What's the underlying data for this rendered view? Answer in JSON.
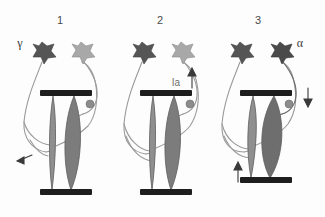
{
  "figure": {
    "background_color": "#fdfdfd",
    "width": 325,
    "height": 217
  },
  "colors": {
    "neuron_dark": "#555555",
    "neuron_light": "#a8a8a8",
    "neuron_darkest": "#4a4a4a",
    "muscle_spindle_fill": "#8f8f8f",
    "muscle_extrafusal_fill": "#7c7c7c",
    "muscle_contracted_fill": "#6e6e6e",
    "bar_black": "#1e1e1e",
    "axon_gray": "#9a9a9a",
    "label_gray": "#4a4a4a",
    "bouton_gray": "#8c8c8c"
  },
  "panels": [
    {
      "id": "panel-1",
      "number": "1",
      "number_x": 60,
      "number_y": 22,
      "labels": [
        {
          "name": "gamma-label",
          "text": "γ",
          "x": 20,
          "y": 46
        }
      ],
      "neurons": [
        {
          "name": "gamma-motor-neuron-soma",
          "shade": "dark",
          "cx": 42,
          "cy": 53
        },
        {
          "name": "alpha-motor-neuron-soma",
          "shade": "light",
          "cx": 81,
          "cy": 53
        }
      ],
      "muscle": {
        "state": "relaxed",
        "spindle_label": "intrafusal-muscle-spindle",
        "extrafusal_label": "extrafusal-muscle-fiber",
        "top_bar_y": 93,
        "bottom_bar_y": 192
      },
      "arrows": [
        {
          "name": "stretch-arrow-diagonal",
          "direction": "down-left",
          "x": 22,
          "y": 157
        }
      ]
    },
    {
      "id": "panel-2",
      "number": "2",
      "number_x": 160,
      "number_y": 22,
      "labels": [
        {
          "name": "ia-afferent-label",
          "text": "Ia",
          "x": 176,
          "y": 82
        }
      ],
      "neurons": [
        {
          "name": "gamma-motor-neuron-soma",
          "shade": "dark",
          "cx": 142,
          "cy": 53
        },
        {
          "name": "alpha-motor-neuron-soma",
          "shade": "light",
          "cx": 181,
          "cy": 53
        }
      ],
      "muscle": {
        "state": "relaxed",
        "spindle_label": "intrafusal-muscle-spindle",
        "extrafusal_label": "extrafusal-muscle-fiber",
        "top_bar_y": 93,
        "bottom_bar_y": 192
      },
      "arrows": [
        {
          "name": "ia-afferent-arrow-up",
          "direction": "up",
          "x": 192,
          "y": 78
        }
      ]
    },
    {
      "id": "panel-3",
      "number": "3",
      "number_x": 258,
      "number_y": 22,
      "labels": [
        {
          "name": "alpha-label",
          "text": "α",
          "x": 298,
          "y": 46
        }
      ],
      "neurons": [
        {
          "name": "gamma-motor-neuron-soma",
          "shade": "dark",
          "cx": 240,
          "cy": 53
        },
        {
          "name": "alpha-motor-neuron-soma",
          "shade": "darkest",
          "cx": 280,
          "cy": 53
        }
      ],
      "muscle": {
        "state": "contracted",
        "spindle_label": "intrafusal-muscle-spindle",
        "extrafusal_label": "extrafusal-muscle-fiber",
        "top_bar_y": 93,
        "bottom_bar_y": 180
      },
      "arrows": [
        {
          "name": "contraction-arrow-up",
          "direction": "up",
          "x": 238,
          "y": 170
        },
        {
          "name": "efferent-arrow-down",
          "direction": "down",
          "x": 308,
          "y": 100
        }
      ]
    }
  ]
}
